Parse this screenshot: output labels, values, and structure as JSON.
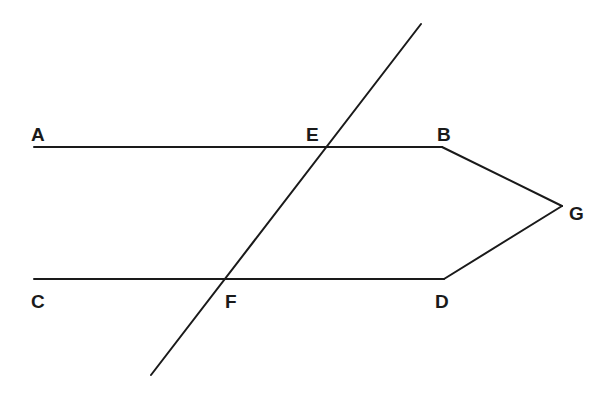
{
  "diagram": {
    "type": "geometry",
    "points": [
      {
        "id": "A",
        "label": "A"
      },
      {
        "id": "B",
        "label": "B"
      },
      {
        "id": "C",
        "label": "C"
      },
      {
        "id": "D",
        "label": "D"
      },
      {
        "id": "E",
        "label": "E"
      },
      {
        "id": "F",
        "label": "F"
      },
      {
        "id": "G",
        "label": "G"
      }
    ],
    "segments": [
      {
        "name": "line-AB",
        "from": "A",
        "to": "B"
      },
      {
        "name": "line-CD",
        "from": "C",
        "to": "D"
      },
      {
        "name": "segment-BG",
        "from": "B",
        "to": "G"
      },
      {
        "name": "segment-DG",
        "from": "D",
        "to": "G"
      },
      {
        "name": "transversal-EF",
        "through": [
          "E",
          "F"
        ]
      }
    ],
    "relations": [
      "AB parallel CD"
    ]
  }
}
